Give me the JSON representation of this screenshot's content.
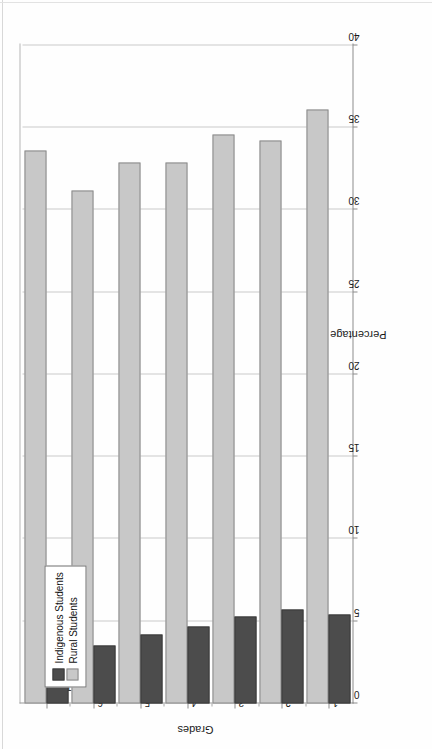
{
  "chart_data": {
    "type": "bar",
    "orientation": "horizontal-rotated",
    "title": "",
    "xlabel": "Grades",
    "ylabel": "Percentage",
    "categories": [
      "1",
      "2",
      "3",
      "4",
      "5",
      "6",
      "Total"
    ],
    "ylim": [
      0,
      40
    ],
    "yticks": [
      0,
      5,
      10,
      15,
      20,
      25,
      30,
      35,
      40
    ],
    "ytick_labels": [
      "0",
      "5",
      "10",
      "15",
      "20",
      "25",
      "30",
      "35",
      "40"
    ],
    "grid": true,
    "legend_position": "top-left",
    "series": [
      {
        "name": "Indigenous Students",
        "color": "#4c4c4c",
        "values": [
          5.4,
          5.7,
          5.3,
          4.7,
          4.2,
          3.5,
          5.2
        ]
      },
      {
        "name": "Rural Students",
        "color": "#c8c8c8",
        "values": [
          36.1,
          34.2,
          34.6,
          32.9,
          32.9,
          31.2,
          33.6
        ]
      }
    ]
  },
  "legend": {
    "items": [
      {
        "label": "Indigenous Students",
        "swatch": "indigenous"
      },
      {
        "label": "Rural Students",
        "swatch": "rural"
      }
    ]
  },
  "axes": {
    "value_axis_title": "Percentage",
    "category_axis_title": "Grades"
  }
}
